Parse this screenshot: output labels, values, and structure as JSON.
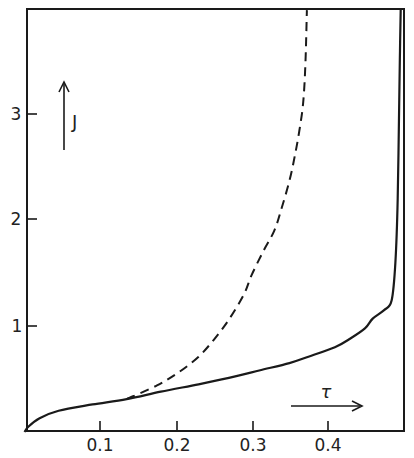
{
  "chart_data": {
    "type": "line",
    "title": "",
    "xlabel": "τ",
    "ylabel": "J",
    "xlim": [
      0,
      0.5
    ],
    "ylim": [
      0,
      3.98
    ],
    "grid": false,
    "legend": null,
    "x_ticks": [
      0.1,
      0.2,
      0.3,
      0.4
    ],
    "x_tick_labels": [
      "0.1",
      "0.2",
      "0.3",
      "0.4"
    ],
    "y_ticks": [
      1,
      2,
      3
    ],
    "y_tick_labels": [
      "1",
      "2",
      "3"
    ],
    "series": [
      {
        "name": "solid",
        "style": "solid",
        "x": [
          0,
          0.005,
          0.02,
          0.045,
          0.09,
          0.135,
          0.18,
          0.23,
          0.27,
          0.31,
          0.35,
          0.375,
          0.41,
          0.43,
          0.45,
          0.46,
          0.475,
          0.485,
          0.49,
          0.493,
          0.495,
          0.496,
          0.497
        ],
        "y": [
          0,
          0.05,
          0.13,
          0.2,
          0.26,
          0.31,
          0.38,
          0.45,
          0.51,
          0.58,
          0.65,
          0.71,
          0.8,
          0.88,
          0.98,
          1.07,
          1.15,
          1.24,
          1.6,
          2.2,
          3.1,
          3.6,
          3.98
        ]
      },
      {
        "name": "dashed",
        "style": "dashed",
        "x": [
          0.135,
          0.175,
          0.205,
          0.23,
          0.25,
          0.27,
          0.29,
          0.3,
          0.315,
          0.33,
          0.34,
          0.35,
          0.357,
          0.363,
          0.368,
          0.371,
          0.373
        ],
        "y": [
          0.31,
          0.44,
          0.57,
          0.71,
          0.87,
          1.06,
          1.3,
          1.48,
          1.7,
          1.9,
          2.12,
          2.37,
          2.6,
          2.84,
          3.1,
          3.45,
          3.98
        ]
      }
    ],
    "annotations": [
      {
        "text": "J",
        "arrow": "up",
        "position": "upper-left"
      },
      {
        "text": "τ",
        "arrow": "right",
        "position": "lower-right"
      }
    ]
  },
  "labels": {
    "x_ticks": [
      "0.1",
      "0.2",
      "0.3",
      "0.4"
    ],
    "y_ticks": [
      "1",
      "2",
      "3"
    ],
    "x_axis_symbol": "τ",
    "y_axis_symbol": "J"
  }
}
